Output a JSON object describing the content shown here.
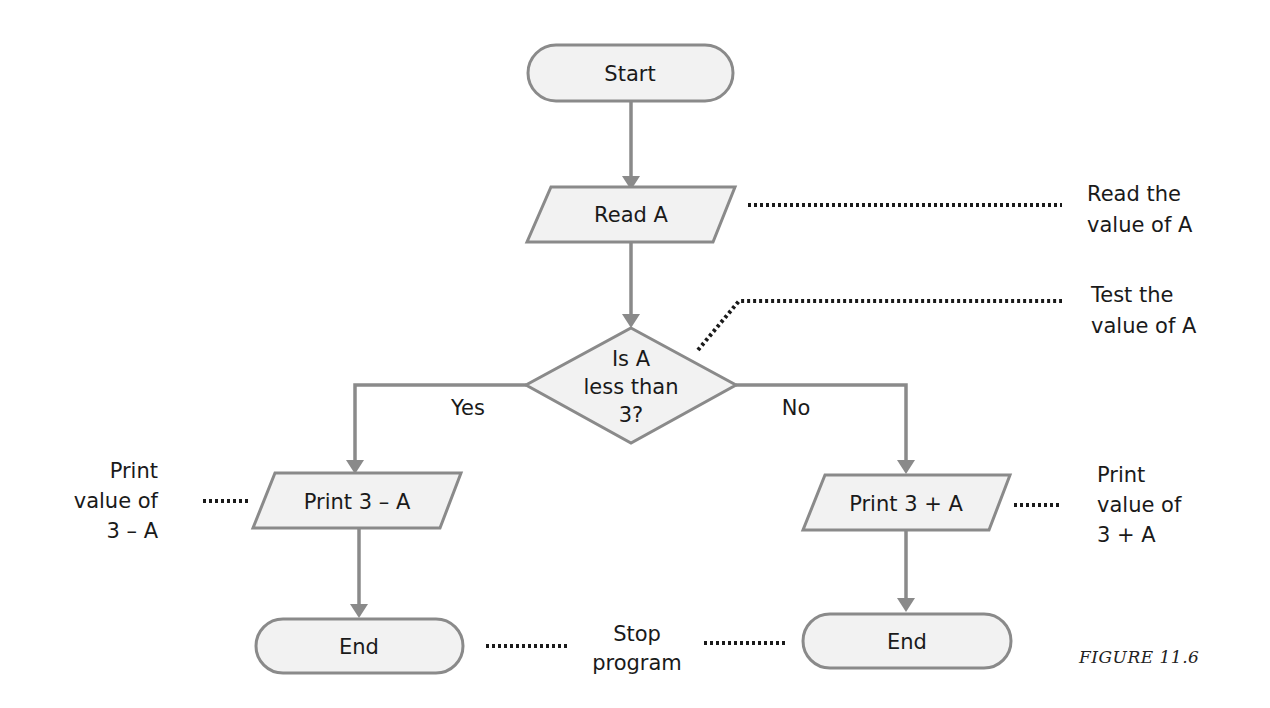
{
  "figure_caption": "FIGURE 11.6",
  "nodes": {
    "start": "Start",
    "read": "Read A",
    "decision": {
      "line1": "Is A",
      "line2": "less than",
      "line3": "3?"
    },
    "print_minus": "Print 3  –  A",
    "print_plus": "Print 3  +  A",
    "end_left": "End",
    "end_right": "End"
  },
  "branches": {
    "yes": "Yes",
    "no": "No"
  },
  "annotations": {
    "read": {
      "line1": "Read the",
      "line2": "value of A"
    },
    "test": {
      "line1": "Test the",
      "line2": "value of A"
    },
    "print_minus": {
      "line1": "Print",
      "line2": "value of",
      "line3": "3  –  A"
    },
    "print_plus": {
      "line1": "Print",
      "line2": "value of",
      "line3": "3  +  A"
    },
    "stop": {
      "line1": "Stop",
      "line2": "program"
    }
  },
  "colors": {
    "shape_fill": "#f2f2f2",
    "shape_stroke": "#8a8a8a",
    "text": "#1a1a1a",
    "dotted": "#1a1a1a"
  }
}
